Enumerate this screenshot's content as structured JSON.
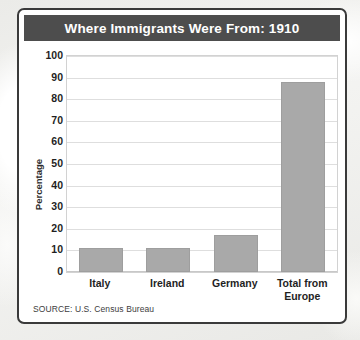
{
  "card": {
    "title": "Where Immigrants Were From: 1910",
    "source": "SOURCE: U.S. Census Bureau"
  },
  "colors": {
    "title_bar": "#4d4d4d",
    "title_text": "#ffffff",
    "bar_fill": "#a9a9a9",
    "card_border": "#3a3a3a",
    "gridline": "#dedede",
    "plot_background": "#ffffff"
  },
  "chart_data": {
    "type": "bar",
    "title": "Where Immigrants Were From: 1910",
    "xlabel": "",
    "ylabel": "Percentage",
    "ylim": [
      0,
      100
    ],
    "ytick_step": 10,
    "yticks": [
      100,
      90,
      80,
      70,
      60,
      50,
      40,
      30,
      20,
      10,
      0
    ],
    "ytick_labels": [
      "100",
      "90",
      "80",
      "70",
      "60",
      "50",
      "40",
      "30",
      "20",
      "10",
      "0"
    ],
    "grid": "horizontal",
    "legend": "none",
    "categories": [
      "Italy",
      "Ireland",
      "Germany",
      "Total from Europe"
    ],
    "category_lines": [
      [
        "Italy"
      ],
      [
        "Ireland"
      ],
      [
        "Germany"
      ],
      [
        "Total from",
        "Europe"
      ]
    ],
    "values": [
      11,
      11,
      17,
      88
    ],
    "series": [
      {
        "name": "Percentage of immigrants",
        "values": [
          11,
          11,
          17,
          88
        ]
      }
    ]
  }
}
